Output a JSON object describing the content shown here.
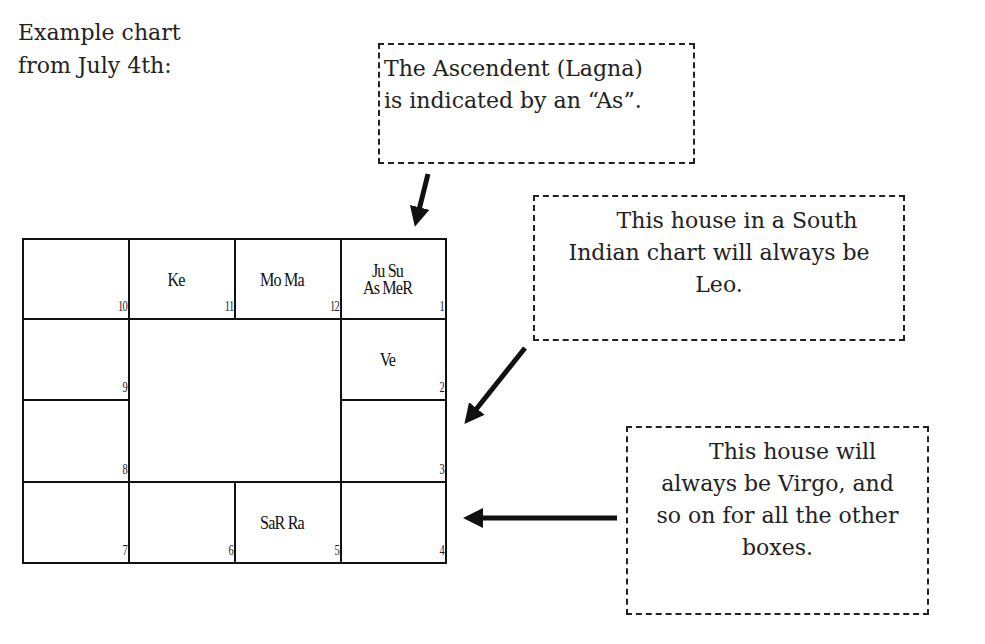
{
  "intro": {
    "lines": [
      "Example chart",
      "from July 4th:"
    ]
  },
  "notes": {
    "ascendant": {
      "lines": [
        "The Ascendent (Lagna)",
        "is indicated by an “As”."
      ]
    },
    "leo": {
      "lines": [
        "This house in a South",
        "Indian chart will always be",
        "Leo."
      ]
    },
    "virgo": {
      "lines": [
        "This house will",
        "always be Virgo, and",
        "so on for all the other",
        "boxes."
      ]
    }
  },
  "chart": {
    "type": "South Indian chart",
    "houses": [
      {
        "house": "10",
        "planets": []
      },
      {
        "house": "11",
        "planets": [
          "Ke"
        ]
      },
      {
        "house": "12",
        "planets": [
          "Mo Ma"
        ]
      },
      {
        "house": "1",
        "planets": [
          "Ju Su",
          "As MeR"
        ]
      },
      {
        "house": "9",
        "planets": []
      },
      {
        "house": "2",
        "planets": [
          "Ve"
        ]
      },
      {
        "house": "8",
        "planets": []
      },
      {
        "house": "3",
        "planets": []
      },
      {
        "house": "7",
        "planets": []
      },
      {
        "house": "6",
        "planets": []
      },
      {
        "house": "5",
        "planets": [
          "SaR Ra"
        ]
      },
      {
        "house": "4",
        "planets": []
      }
    ]
  },
  "colors": {
    "ink": "#111111",
    "background": "#ffffff"
  }
}
